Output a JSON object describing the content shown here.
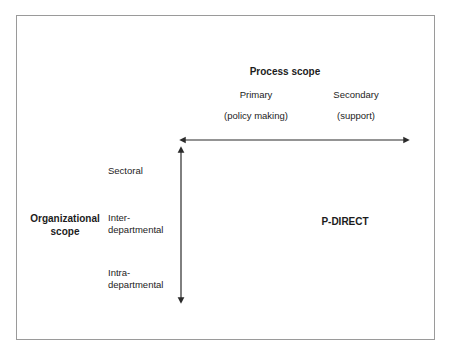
{
  "figure": {
    "kind": "two-axis-positioning-diagram",
    "frame_border_color": "#9a9a9a",
    "background_color": "#ffffff",
    "line_color": "#2b2b2b"
  },
  "process_scope": {
    "title": "Process scope",
    "categories": [
      {
        "label": "Primary",
        "sublabel": "(policy making)"
      },
      {
        "label": "Secondary",
        "sublabel": "(support)"
      }
    ]
  },
  "organizational_scope": {
    "title": "Organizational scope",
    "title_line1": "Organizational",
    "title_line2": "scope",
    "levels": [
      {
        "label": "Sectoral"
      },
      {
        "label": "Inter-departmental",
        "line1": "Inter-",
        "line2": "departmental"
      },
      {
        "label": "Intra-departmental",
        "line1": "Intra-",
        "line2": "departmental"
      }
    ]
  },
  "plotted_item": {
    "label": "P-DIRECT"
  },
  "axes": {
    "horizontal": {
      "name": "process-scope-axis",
      "arrowheads": "both",
      "x_start": 183,
      "x_end": 406,
      "y": 140
    },
    "vertical": {
      "name": "organizational-scope-axis",
      "arrowheads": "both",
      "x": 181,
      "y_start": 150,
      "y_end": 300
    }
  }
}
